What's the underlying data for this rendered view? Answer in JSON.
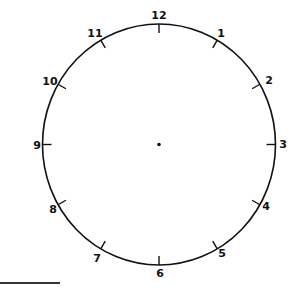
{
  "diagram": {
    "type": "clock-face",
    "center_dot": true,
    "hands": "none",
    "numbers": [
      {
        "label": "12",
        "x": 159,
        "y": 19
      },
      {
        "label": "1",
        "x": 221,
        "y": 37
      },
      {
        "label": "2",
        "x": 269,
        "y": 84
      },
      {
        "label": "3",
        "x": 283,
        "y": 147
      },
      {
        "label": "4",
        "x": 266,
        "y": 210
      },
      {
        "label": "5",
        "x": 222,
        "y": 256
      },
      {
        "label": "6",
        "x": 160,
        "y": 276
      },
      {
        "label": "7",
        "x": 97,
        "y": 261
      },
      {
        "label": "8",
        "x": 53,
        "y": 213
      },
      {
        "label": "9",
        "x": 37,
        "y": 149
      },
      {
        "label": "10",
        "x": 50,
        "y": 84
      },
      {
        "label": "11",
        "x": 95,
        "y": 37
      }
    ],
    "colors": {
      "stroke": "#111111",
      "background": "#ffffff"
    }
  }
}
